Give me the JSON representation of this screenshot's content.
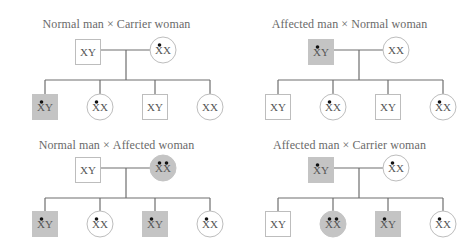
{
  "diagram": {
    "type": "X-linked recessive inheritance pedigree crosses",
    "legend_semantics": {
      "square": "male",
      "circle": "female",
      "shaded": "affected",
      "dot": "X chromosome carrying recessive allele"
    },
    "colors": {
      "affected_fill": "#c4c4c4",
      "outline": "#bdbdbd",
      "line": "#6e6e6e",
      "dot": "#111111",
      "text": "#555555"
    },
    "panels": [
      {
        "title_left": "Normal man",
        "cross": "×",
        "title_right": "Carrier woman",
        "father": {
          "label": "XY",
          "affected": false,
          "dots": 0
        },
        "mother": {
          "label": "XX",
          "affected": false,
          "dots": 1
        },
        "children": [
          {
            "sex": "male",
            "label": "XY",
            "affected": true,
            "dots": 1
          },
          {
            "sex": "female",
            "label": "XX",
            "affected": false,
            "dots": 1
          },
          {
            "sex": "male",
            "label": "XY",
            "affected": false,
            "dots": 0
          },
          {
            "sex": "female",
            "label": "XX",
            "affected": false,
            "dots": 0
          }
        ]
      },
      {
        "title_left": "Affected man",
        "cross": "×",
        "title_right": "Normal woman",
        "father": {
          "label": "XY",
          "affected": true,
          "dots": 1
        },
        "mother": {
          "label": "XX",
          "affected": false,
          "dots": 0
        },
        "children": [
          {
            "sex": "male",
            "label": "XY",
            "affected": false,
            "dots": 0
          },
          {
            "sex": "female",
            "label": "XX",
            "affected": false,
            "dots": 1
          },
          {
            "sex": "male",
            "label": "XY",
            "affected": false,
            "dots": 0
          },
          {
            "sex": "female",
            "label": "XX",
            "affected": false,
            "dots": 1
          }
        ]
      },
      {
        "title_left": "Normal man",
        "cross": "×",
        "title_right": "Affected woman",
        "father": {
          "label": "XY",
          "affected": false,
          "dots": 0
        },
        "mother": {
          "label": "XX",
          "affected": true,
          "dots": 2
        },
        "children": [
          {
            "sex": "male",
            "label": "XY",
            "affected": true,
            "dots": 1
          },
          {
            "sex": "female",
            "label": "XX",
            "affected": false,
            "dots": 1
          },
          {
            "sex": "male",
            "label": "XY",
            "affected": true,
            "dots": 1
          },
          {
            "sex": "female",
            "label": "XX",
            "affected": false,
            "dots": 1
          }
        ]
      },
      {
        "title_left": "Affected man",
        "cross": "×",
        "title_right": "Carrier woman",
        "father": {
          "label": "XY",
          "affected": true,
          "dots": 1
        },
        "mother": {
          "label": "XX",
          "affected": false,
          "dots": 1
        },
        "children": [
          {
            "sex": "male",
            "label": "XY",
            "affected": false,
            "dots": 0
          },
          {
            "sex": "female",
            "label": "XX",
            "affected": true,
            "dots": 2
          },
          {
            "sex": "male",
            "label": "XY",
            "affected": true,
            "dots": 1
          },
          {
            "sex": "female",
            "label": "XX",
            "affected": false,
            "dots": 1
          }
        ]
      }
    ]
  }
}
